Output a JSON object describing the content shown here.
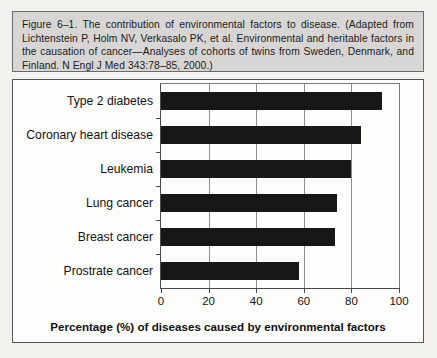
{
  "figure": {
    "caption": "Figure 6–1. The contribution of environmental factors to disease. (Adapted from Lichtenstein P, Holm NV, Verkasalo PK, et al. Environmental and heritable factors in the causation of cancer—Analyses of cohorts of twins from Sweden, Denmark, and Finland. N Engl J Med 343:78–85, 2000.)"
  },
  "chart_data": {
    "type": "bar",
    "orientation": "horizontal",
    "title": "",
    "xlabel": "Percentage (%) of diseases caused by environmental factors",
    "ylabel": "",
    "xlim": [
      0,
      100
    ],
    "xticks": [
      0,
      20,
      40,
      60,
      80,
      100
    ],
    "xtick_labels": [
      "0",
      "20",
      "40",
      "60",
      "80",
      "100"
    ],
    "grid": "vertical",
    "legend": "none",
    "bar_color": "#171717",
    "categories": [
      "Type 2 diabetes",
      "Coronary heart disease",
      "Leukemia",
      "Lung cancer",
      "Breast cancer",
      "Prostrate cancer"
    ],
    "values": [
      93,
      84,
      80,
      74,
      73,
      58
    ]
  }
}
